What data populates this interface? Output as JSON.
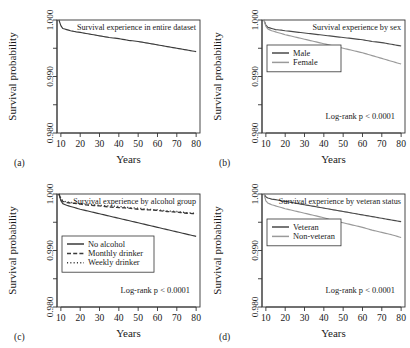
{
  "figure": {
    "kind": "survival-curve-panel-figure",
    "width": 410,
    "height": 348,
    "background": "#ffffff",
    "ink": "#333333",
    "secondary_ink": "#8c8c8c"
  },
  "axes": {
    "xlabel": "Years",
    "ylabel": "Survival probability",
    "xticks": [
      10,
      20,
      30,
      40,
      50,
      60,
      70,
      80
    ],
    "xticklabels": [
      "10",
      "20",
      "30",
      "40",
      "50",
      "60",
      "70",
      "80"
    ],
    "yticks": [
      1.0,
      0.995,
      0.99,
      0.985,
      0.98
    ],
    "yticklabels": [
      "1.000",
      "",
      "0.990",
      "",
      "0.980"
    ],
    "xlim": [
      8,
      82
    ],
    "ylim": [
      0.98,
      1.0
    ],
    "grid": false
  },
  "panels": [
    {
      "tag": "(a)",
      "title": "Survival experience in entire dataset",
      "pvalue": "",
      "legend": []
    },
    {
      "tag": "(b)",
      "title": "Survival experience by sex",
      "pvalue": "Log-rank p < 0.0001",
      "legend": [
        {
          "label": "Male",
          "color": "#4a4a4a",
          "style": "solid"
        },
        {
          "label": "Female",
          "color": "#9a9a9a",
          "style": "solid"
        }
      ]
    },
    {
      "tag": "(c)",
      "title": "Survival experience by alcohol group",
      "pvalue": "Log-rank p < 0.0001",
      "legend": [
        {
          "label": "No alcohol",
          "color": "#3a3a3a",
          "style": "solid"
        },
        {
          "label": "Monthly drinker",
          "color": "#3a3a3a",
          "style": "dashed"
        },
        {
          "label": "Weekly drinker",
          "color": "#3a3a3a",
          "style": "dotted"
        }
      ]
    },
    {
      "tag": "(d)",
      "title": "Survival experience by veteran status",
      "pvalue": "Log-rank p < 0.0001",
      "legend": [
        {
          "label": "Veteran",
          "color": "#4a4a4a",
          "style": "solid"
        },
        {
          "label": "Non-veteran",
          "color": "#9a9a9a",
          "style": "solid"
        }
      ]
    }
  ],
  "chart_data": [
    {
      "type": "line",
      "panel": "(a)",
      "title": "Survival experience in entire dataset",
      "xlabel": "Years",
      "ylabel": "Survival probability",
      "xlim": [
        8,
        82
      ],
      "ylim": [
        0.98,
        1.0
      ],
      "grid": false,
      "x": [
        9,
        10,
        11,
        13,
        15,
        18,
        20,
        25,
        30,
        35,
        40,
        45,
        50,
        55,
        60,
        65,
        70,
        75,
        80
      ],
      "series": [
        {
          "name": "All subjects",
          "color": "#3a3a3a",
          "style": "solid",
          "values": [
            1.0,
            0.999,
            0.9985,
            0.9983,
            0.9981,
            0.9979,
            0.9978,
            0.9975,
            0.9972,
            0.9969,
            0.9967,
            0.9964,
            0.9962,
            0.9959,
            0.9956,
            0.9953,
            0.995,
            0.9947,
            0.9944
          ]
        }
      ]
    },
    {
      "type": "line",
      "panel": "(b)",
      "title": "Survival experience by sex",
      "xlabel": "Years",
      "ylabel": "Survival probability",
      "xlim": [
        8,
        82
      ],
      "ylim": [
        0.98,
        1.0
      ],
      "grid": false,
      "annotation": "Log-rank p < 0.0001",
      "x": [
        9,
        10,
        11,
        13,
        15,
        18,
        20,
        25,
        30,
        35,
        40,
        45,
        50,
        55,
        60,
        65,
        70,
        75,
        80
      ],
      "series": [
        {
          "name": "Male",
          "color": "#4a4a4a",
          "style": "solid",
          "values": [
            1.0,
            0.9991,
            0.9987,
            0.9985,
            0.9983,
            0.9982,
            0.9981,
            0.9979,
            0.9977,
            0.9975,
            0.9973,
            0.9971,
            0.9969,
            0.9967,
            0.9965,
            0.9962,
            0.996,
            0.9957,
            0.9954
          ]
        },
        {
          "name": "Female",
          "color": "#9a9a9a",
          "style": "solid",
          "values": [
            1.0,
            0.9989,
            0.9984,
            0.9981,
            0.9979,
            0.9976,
            0.9974,
            0.997,
            0.9966,
            0.9962,
            0.9958,
            0.9954,
            0.995,
            0.9946,
            0.9942,
            0.9937,
            0.9932,
            0.9927,
            0.9922
          ]
        }
      ]
    },
    {
      "type": "line",
      "panel": "(c)",
      "title": "Survival experience by alcohol group",
      "xlabel": "Years",
      "ylabel": "Survival probability",
      "xlim": [
        8,
        82
      ],
      "ylim": [
        0.98,
        1.0
      ],
      "grid": false,
      "annotation": "Log-rank p < 0.0001",
      "x": [
        9,
        10,
        11,
        13,
        15,
        18,
        20,
        25,
        30,
        35,
        40,
        45,
        50,
        55,
        60,
        65,
        70,
        75,
        80
      ],
      "series": [
        {
          "name": "No alcohol",
          "color": "#3a3a3a",
          "style": "solid",
          "values": [
            1.0,
            0.9988,
            0.9983,
            0.998,
            0.9978,
            0.9975,
            0.9973,
            0.9969,
            0.9965,
            0.9961,
            0.9957,
            0.9953,
            0.9949,
            0.9945,
            0.9941,
            0.9937,
            0.9933,
            0.9929,
            0.9925
          ]
        },
        {
          "name": "Monthly drinker",
          "color": "#3a3a3a",
          "style": "dashed",
          "values": [
            1.0,
            0.9991,
            0.9987,
            0.9985,
            0.9984,
            0.9983,
            0.9982,
            0.998,
            0.9979,
            0.9977,
            0.9976,
            0.9975,
            0.9973,
            0.9972,
            0.9971,
            0.9969,
            0.9968,
            0.9966,
            0.9965
          ]
        },
        {
          "name": "Weekly drinker",
          "color": "#3a3a3a",
          "style": "dotted",
          "values": [
            1.0,
            0.9992,
            0.9988,
            0.9986,
            0.9985,
            0.9984,
            0.9983,
            0.9982,
            0.998,
            0.9979,
            0.9978,
            0.9976,
            0.9975,
            0.9973,
            0.9972,
            0.997,
            0.9969,
            0.9967,
            0.9966
          ]
        }
      ]
    },
    {
      "type": "line",
      "panel": "(d)",
      "title": "Survival experience by veteran status",
      "xlabel": "Years",
      "ylabel": "Survival probability",
      "xlim": [
        8,
        82
      ],
      "ylim": [
        0.98,
        1.0
      ],
      "grid": false,
      "annotation": "Log-rank p < 0.0001",
      "x": [
        9,
        10,
        11,
        13,
        15,
        18,
        20,
        25,
        30,
        35,
        40,
        45,
        50,
        55,
        60,
        65,
        70,
        75,
        80
      ],
      "series": [
        {
          "name": "Veteran",
          "color": "#4a4a4a",
          "style": "solid",
          "values": [
            1.0,
            0.9995,
            0.9993,
            0.9991,
            0.999,
            0.9988,
            0.9987,
            0.9984,
            0.9981,
            0.9978,
            0.9975,
            0.9972,
            0.9969,
            0.9966,
            0.9963,
            0.996,
            0.9957,
            0.9954,
            0.9951
          ]
        },
        {
          "name": "Non-veteran",
          "color": "#9a9a9a",
          "style": "solid",
          "values": [
            1.0,
            0.9988,
            0.9984,
            0.9981,
            0.9979,
            0.9976,
            0.9974,
            0.997,
            0.9966,
            0.9962,
            0.9958,
            0.9953,
            0.9949,
            0.9945,
            0.9941,
            0.9936,
            0.9932,
            0.9928,
            0.9923
          ]
        }
      ]
    }
  ]
}
